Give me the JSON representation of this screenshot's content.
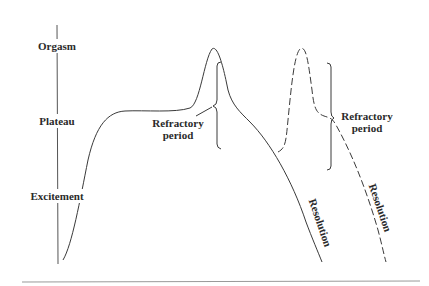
{
  "diagram": {
    "axis_labels": [
      "Orgasm",
      "Plateau",
      "Excitement"
    ],
    "annotations": {
      "refractory_1": [
        "Refractory",
        "period"
      ],
      "refractory_2": [
        "Refractory",
        "period"
      ],
      "resolution_1": "Resolution",
      "resolution_2": "Resolution"
    },
    "colors": {
      "line": "#3a3a3a",
      "text": "#2a2a2a",
      "baseline": "#9a9a9a"
    }
  }
}
